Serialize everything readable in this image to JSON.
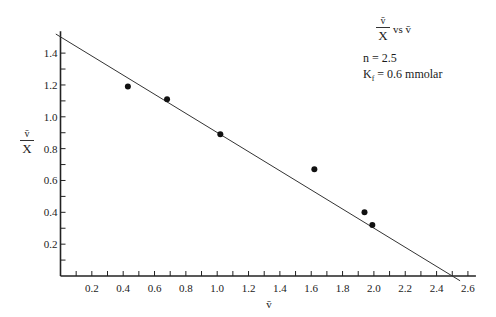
{
  "chart_data": {
    "type": "scatter",
    "title_parts": {
      "numerator": "v̄",
      "denominator": "X",
      "suffix": "vs v̄"
    },
    "annotations": [
      "n = 2.5",
      "K_f = 0.6 mmolar"
    ],
    "annotation_text": {
      "n": "n = 2.5",
      "kf_prefix": "K",
      "kf_sub": "f",
      "kf_rest": " = 0.6 mmolar"
    },
    "xlabel": "v̄",
    "ylabel": {
      "numerator": "v̄",
      "denominator": "X"
    },
    "xlim": [
      0,
      2.6
    ],
    "ylim": [
      0,
      1.55
    ],
    "x_ticks": [
      0.2,
      0.4,
      0.6,
      0.8,
      1.0,
      1.2,
      1.4,
      1.6,
      1.8,
      2.0,
      2.2,
      2.4,
      2.6
    ],
    "x_tick_labels": [
      "0.2",
      "0.4",
      "0.6",
      "0.8",
      "1.0",
      "1.2",
      "1.4",
      "1.6",
      "1.8",
      "2.0",
      "2.2",
      "2.4",
      "2.6"
    ],
    "x_minor_step": 0.1,
    "y_ticks": [
      0.2,
      0.4,
      0.6,
      0.8,
      1.0,
      1.2,
      1.4
    ],
    "y_tick_labels": [
      "0.2",
      "0.4",
      "0.6",
      "0.8",
      "1.0",
      "1.2",
      "1.4"
    ],
    "y_minor_step": 0.1,
    "grid": false,
    "points": [
      {
        "x": 0.43,
        "y": 1.19
      },
      {
        "x": 0.68,
        "y": 1.11
      },
      {
        "x": 1.02,
        "y": 0.89
      },
      {
        "x": 1.62,
        "y": 0.67
      },
      {
        "x": 1.94,
        "y": 0.4
      },
      {
        "x": 1.99,
        "y": 0.32
      }
    ],
    "fit_line": {
      "x_start": -0.03,
      "y_start": 1.52,
      "x_end": 2.55,
      "y_end": -0.03,
      "y_intercept": 1.5,
      "x_intercept": 2.5
    }
  }
}
